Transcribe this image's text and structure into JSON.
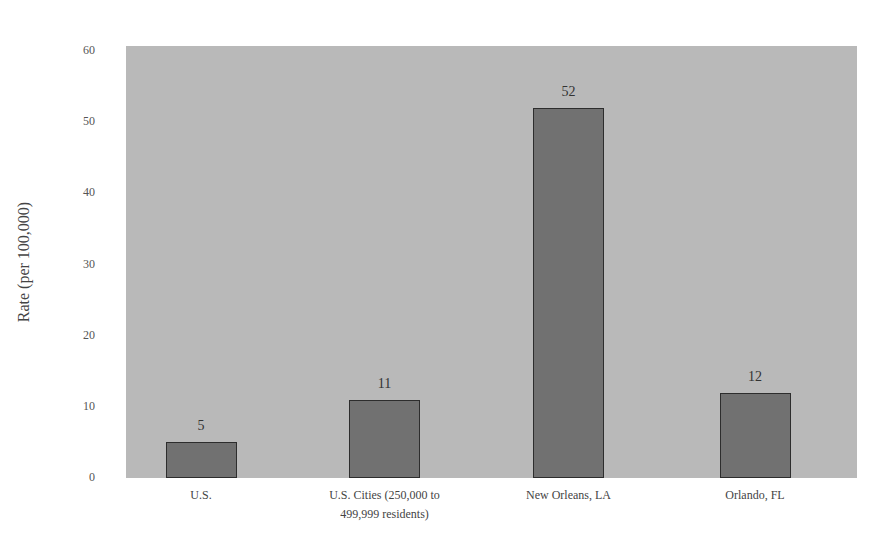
{
  "chart_data": {
    "type": "bar",
    "title": "",
    "xlabel": "",
    "ylabel": "Rate (per 100,000)",
    "ylim": [
      0,
      60
    ],
    "yticks": [
      "0",
      "10",
      "20",
      "30",
      "40",
      "50",
      "60"
    ],
    "grid": false,
    "legend": null,
    "categories": [
      "U.S.",
      "U.S. Cities (250,000 to 499,999 residents)",
      "New Orleans, LA",
      "Orlando, FL"
    ],
    "category_lines": [
      [
        "U.S."
      ],
      [
        "U.S. Cities (250,000 to",
        "499,999 residents)"
      ],
      [
        "New Orleans, LA"
      ],
      [
        "Orlando, FL"
      ]
    ],
    "values": [
      5,
      11,
      52,
      12
    ],
    "value_labels": [
      "5",
      "11",
      "52",
      "12"
    ],
    "colors": {
      "bar": "#717171",
      "bar_border": "#2d2d2d",
      "plot_background": "#b9b9b9"
    }
  }
}
